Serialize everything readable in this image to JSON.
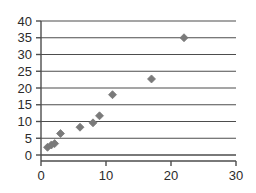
{
  "chart_data": {
    "type": "scatter",
    "title": "",
    "subtitle": "",
    "xlabel": "",
    "ylabel": "",
    "xlim": [
      0,
      30
    ],
    "ylim": [
      0,
      40
    ],
    "xticks": [
      0,
      10,
      20,
      30
    ],
    "yticks": [
      0,
      5,
      10,
      15,
      20,
      25,
      30,
      35,
      40
    ],
    "xtick_labels": [
      "0",
      "10",
      "20",
      "30"
    ],
    "ytick_labels": [
      "0",
      "5",
      "10",
      "15",
      "20",
      "25",
      "30",
      "35",
      "40"
    ],
    "grid": {
      "horizontal": true,
      "vertical": false,
      "color": "#4d4d4d"
    },
    "legend": {
      "visible": false,
      "position": "none",
      "entries": []
    },
    "annotations": [],
    "series": [
      {
        "name": "Series 1",
        "marker": "diamond",
        "marker_color": "#7a7a7a",
        "marker_size": 8,
        "points": [
          {
            "x": 1.0,
            "y": 2.3
          },
          {
            "x": 1.6,
            "y": 3.0
          },
          {
            "x": 2.1,
            "y": 3.4
          },
          {
            "x": 3.0,
            "y": 6.4
          },
          {
            "x": 6.0,
            "y": 8.3
          },
          {
            "x": 8.0,
            "y": 9.6
          },
          {
            "x": 9.0,
            "y": 11.7
          },
          {
            "x": 11.0,
            "y": 18.0
          },
          {
            "x": 17.0,
            "y": 22.7
          },
          {
            "x": 22.0,
            "y": 35.0
          }
        ]
      }
    ]
  },
  "style": {
    "background": "#ffffff",
    "axis_color": "#4d4d4d",
    "tick_label_color": "#2b2b2b"
  },
  "geometry": {
    "plot_left": 41,
    "plot_right": 236,
    "plot_top": 21,
    "plot_bottom": 155
  }
}
